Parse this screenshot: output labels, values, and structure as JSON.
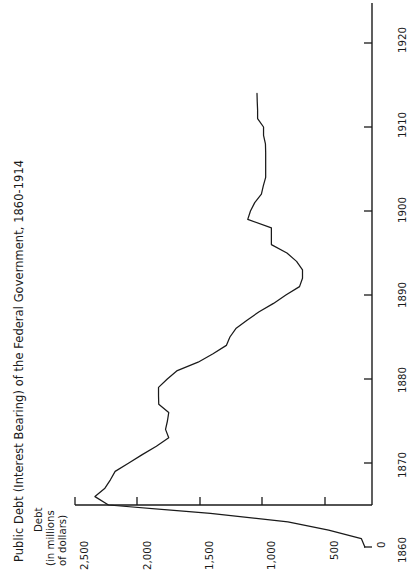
{
  "figure": {
    "title": "Public Debt (Interest Bearing) of the Federal Government, 1860-1914",
    "orientation": "rotated-90-ccw",
    "background_color": "#ffffff",
    "line_color": "#1a1a1a"
  },
  "value_axis": {
    "label_lines": [
      "Debt",
      "(in millions",
      "of dollars)"
    ],
    "tick_labels": [
      "2,500",
      "2,000",
      "1,500",
      "1,000",
      "500",
      "0"
    ],
    "tick_values": [
      2500,
      2000,
      1500,
      1000,
      500,
      0
    ]
  },
  "year_axis": {
    "tick_labels": [
      "1860",
      "1870",
      "1880",
      "1890",
      "1900",
      "1910",
      "1920"
    ],
    "tick_values": [
      1860,
      1870,
      1880,
      1890,
      1900,
      1910,
      1920
    ]
  },
  "chart_data": {
    "type": "line",
    "title": "Public Debt (Interest Bearing) of the Federal Government, 1860-1914",
    "xlabel": "",
    "ylabel": "Debt (in millions of dollars)",
    "xlim": [
      1860,
      1920
    ],
    "ylim": [
      0,
      2500
    ],
    "grid": false,
    "legend": "none",
    "series": [
      {
        "name": "Public Debt (Interest Bearing)",
        "x": [
          1860,
          1861,
          1862,
          1863,
          1864,
          1865,
          1866,
          1867,
          1868,
          1869,
          1870,
          1871,
          1872,
          1873,
          1874,
          1875,
          1876,
          1877,
          1878,
          1879,
          1880,
          1881,
          1882,
          1883,
          1884,
          1885,
          1886,
          1887,
          1888,
          1889,
          1890,
          1891,
          1892,
          1893,
          1894,
          1895,
          1896,
          1897,
          1898,
          1899,
          1900,
          1901,
          1902,
          1903,
          1904,
          1905,
          1906,
          1907,
          1908,
          1909,
          1910,
          1911,
          1912,
          1913,
          1914
        ],
        "y": [
          60,
          90,
          365,
          708,
          1360,
          2218,
          2332,
          2248,
          2202,
          2162,
          2047,
          1934,
          1815,
          1711,
          1738,
          1722,
          1711,
          1795,
          1797,
          1797,
          1723,
          1639,
          1464,
          1338,
          1226,
          1196,
          1146,
          1052,
          950,
          829,
          725,
          610,
          585,
          585,
          635,
          716,
          847,
          847,
          847,
          1046,
          1023,
          987,
          931,
          915,
          895,
          895,
          895,
          895,
          897,
          913,
          913,
          963,
          963,
          966,
          968
        ]
      }
    ]
  }
}
